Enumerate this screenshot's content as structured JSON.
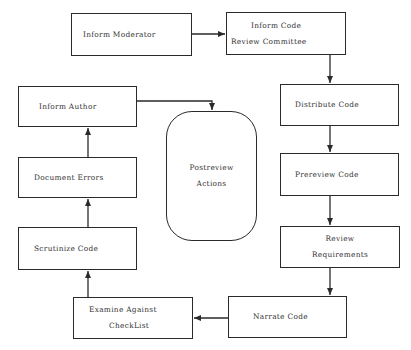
{
  "diagram": {
    "type": "flowchart",
    "title": "",
    "nodes": [
      {
        "id": "inform_moderator",
        "lines": [
          "Inform Moderator"
        ],
        "shape": "rect"
      },
      {
        "id": "inform_committee",
        "lines": [
          "Inform Code",
          "Review Committee"
        ],
        "shape": "rect"
      },
      {
        "id": "distribute_code",
        "lines": [
          "Distribute Code"
        ],
        "shape": "rect"
      },
      {
        "id": "prereview_code",
        "lines": [
          "Prereview Code"
        ],
        "shape": "rect"
      },
      {
        "id": "review_requirements",
        "lines": [
          "Review",
          "Requirements"
        ],
        "shape": "rect"
      },
      {
        "id": "narrate_code",
        "lines": [
          "Narrate Code"
        ],
        "shape": "rect"
      },
      {
        "id": "examine_checklist",
        "lines": [
          "Examine Against",
          "CheckList"
        ],
        "shape": "rect"
      },
      {
        "id": "scrutinize_code",
        "lines": [
          "Scrutinize Code"
        ],
        "shape": "rect"
      },
      {
        "id": "document_errors",
        "lines": [
          "Document Errors"
        ],
        "shape": "rect"
      },
      {
        "id": "inform_author",
        "lines": [
          "Inform Author"
        ],
        "shape": "rect"
      },
      {
        "id": "postreview_actions",
        "lines": [
          "Postreview",
          "Actions"
        ],
        "shape": "rounded"
      }
    ],
    "edges": [
      {
        "from": "inform_moderator",
        "to": "inform_committee"
      },
      {
        "from": "inform_committee",
        "to": "distribute_code"
      },
      {
        "from": "distribute_code",
        "to": "prereview_code"
      },
      {
        "from": "prereview_code",
        "to": "review_requirements"
      },
      {
        "from": "review_requirements",
        "to": "narrate_code"
      },
      {
        "from": "narrate_code",
        "to": "examine_checklist"
      },
      {
        "from": "examine_checklist",
        "to": "scrutinize_code"
      },
      {
        "from": "scrutinize_code",
        "to": "document_errors"
      },
      {
        "from": "document_errors",
        "to": "inform_author"
      },
      {
        "from": "inform_author",
        "to": "postreview_actions"
      }
    ]
  },
  "colors": {
    "stroke": "#2a2a2a",
    "text": "#333333",
    "background": "#ffffff"
  }
}
